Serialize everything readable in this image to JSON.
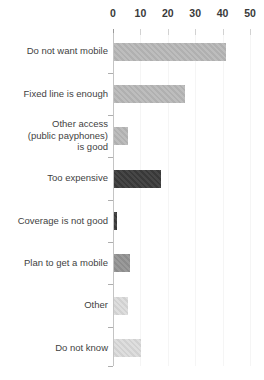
{
  "chart_data": {
    "type": "bar",
    "orientation": "horizontal",
    "title": "",
    "xlabel": "",
    "ylabel": "",
    "x_axis": {
      "position": "top",
      "tick_labels": [
        "0",
        "10",
        "20",
        "30",
        "40",
        "50"
      ],
      "tick_values": [
        0,
        10,
        20,
        30,
        40,
        50
      ],
      "range": [
        0,
        55
      ]
    },
    "grid": false,
    "legend": false,
    "categories": [
      "Do not want mobile",
      "Fixed line is enough",
      "Other access (public payphones) is good",
      "Too expensive",
      "Coverage is not good",
      "Plan to get a mobile",
      "Other",
      "Do not know"
    ],
    "category_lines": [
      [
        "Do not want mobile"
      ],
      [
        "Fixed line is enough"
      ],
      [
        "Other access",
        "(public payphones)",
        "is good"
      ],
      [
        "Too expensive"
      ],
      [
        "Coverage is not good"
      ],
      [
        "Plan to get a mobile"
      ],
      [
        "Other"
      ],
      [
        "Do not know"
      ]
    ],
    "values": [
      41,
      26,
      5,
      17,
      1,
      6,
      5,
      10
    ],
    "bar_colors": [
      "#b9b9b9",
      "#b9b9b9",
      "#b9b9b9",
      "#3b3b3b",
      "#3b3b3b",
      "#949494",
      "#dcdcdc",
      "#dcdcdc"
    ]
  },
  "colors": {
    "background": "#ffffff",
    "axis_line": "#c4c4c4",
    "tick_mark": "#aeaeae",
    "tick_text": "#3a3a3a",
    "label_text": "#3f3f3f"
  }
}
